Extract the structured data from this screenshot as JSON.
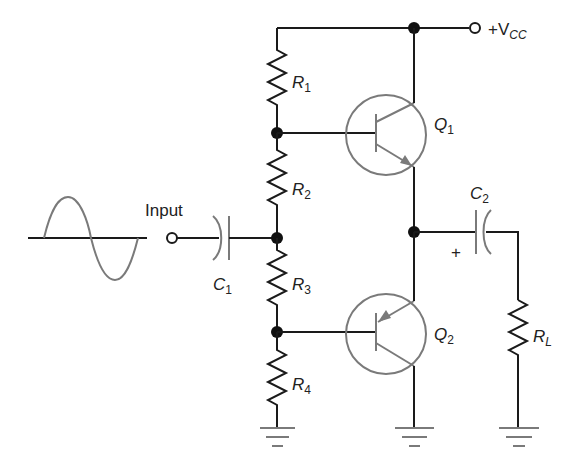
{
  "diagram": {
    "type": "circuit-schematic",
    "colors": {
      "wire": "#1a1a1a",
      "symbol_gray": "#7a7a7a",
      "node": "#111111",
      "background": "#ffffff"
    },
    "labels": {
      "input": "Input",
      "vcc_prefix": "+V",
      "vcc_sub": "CC",
      "r1": "R",
      "r1_sub": "1",
      "r2": "R",
      "r2_sub": "2",
      "r3": "R",
      "r3_sub": "3",
      "r4": "R",
      "r4_sub": "4",
      "rl": "R",
      "rl_sub": "L",
      "c1": "C",
      "c1_sub": "1",
      "c2": "C",
      "c2_sub": "2",
      "q1": "Q",
      "q1_sub": "1",
      "q2": "Q",
      "q2_sub": "2",
      "c2_polarity": "+"
    },
    "components": [
      {
        "id": "R1",
        "kind": "resistor"
      },
      {
        "id": "R2",
        "kind": "resistor"
      },
      {
        "id": "R3",
        "kind": "resistor"
      },
      {
        "id": "R4",
        "kind": "resistor"
      },
      {
        "id": "RL",
        "kind": "resistor",
        "role": "load"
      },
      {
        "id": "C1",
        "kind": "capacitor",
        "role": "input coupling"
      },
      {
        "id": "C2",
        "kind": "polarized-capacitor",
        "role": "output coupling"
      },
      {
        "id": "Q1",
        "kind": "npn-transistor"
      },
      {
        "id": "Q2",
        "kind": "pnp-transistor"
      },
      {
        "id": "source",
        "kind": "sine-wave-input"
      },
      {
        "id": "gnd",
        "kind": "ground",
        "count": 3
      }
    ]
  }
}
